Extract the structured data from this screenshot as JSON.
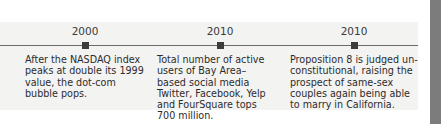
{
  "timeline": {
    "events": [
      {
        "year": "2000",
        "description": "After the NASDAQ index peaks at double its 1999 value, the dot-com bubble pops."
      },
      {
        "year": "2010",
        "description": "Total number of active users of Bay Area–based social media Twitter, Facebook, Yelp and FourSquare tops 700 million."
      },
      {
        "year": "2010",
        "description": "Proposition 8 is judged un-constitutional, raising the prospect of same-sex couples again being able to marry in California."
      }
    ]
  },
  "colors": {
    "panel_background": "#f3f3f2",
    "line": "#6a6a6a",
    "marker": "#3c3c3c",
    "sidebar": "#7c7c7c"
  }
}
